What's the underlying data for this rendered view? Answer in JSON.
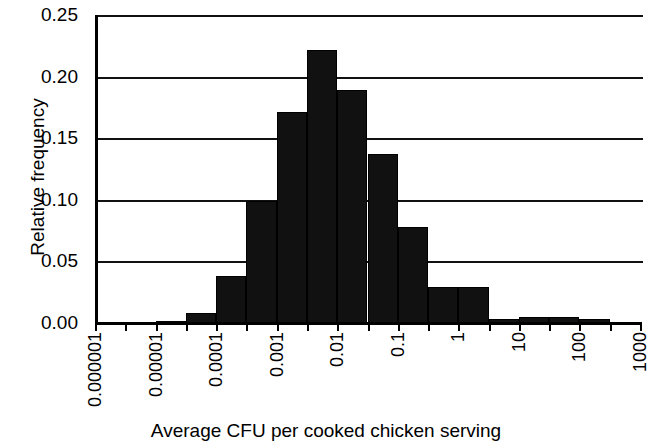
{
  "chart_data": {
    "type": "bar",
    "title": "",
    "subtitle": "",
    "xlabel": "Average CFU per cooked chicken serving",
    "ylabel": "Relative frequency",
    "xscale": "log",
    "xlim": [
      1e-06,
      1000
    ],
    "ylim": [
      0.0,
      0.25
    ],
    "grid": true,
    "legend": null,
    "bar_color": "#111111",
    "axis_color": "#000000",
    "yticks": [
      "0.25",
      "0.20",
      "0.15",
      "0.10",
      "0.05",
      "0.00"
    ],
    "ytick_values": [
      0.25,
      0.2,
      0.15,
      0.1,
      0.05,
      0.0
    ],
    "xticks": [
      "0.000001",
      "0.00001",
      "0.0001",
      "0.001",
      "0.01",
      "0.1",
      "1",
      "10",
      "100",
      "1000"
    ],
    "xtick_values": [
      1e-06,
      1e-05,
      0.0001,
      0.001,
      0.01,
      0.1,
      1,
      10,
      100,
      1000
    ],
    "bins_per_decade": 2,
    "categories": [
      "1e-6",
      "3.2e-6",
      "1e-5",
      "3.2e-5",
      "1e-4",
      "3.2e-4",
      "1e-3",
      "3.2e-3",
      "1e-2",
      "3.2e-2",
      "1e-1",
      "3.2e-1",
      "1",
      "3.2",
      "10",
      "32",
      "100",
      "320"
    ],
    "values": [
      0.0,
      0.0,
      0.002,
      0.008,
      0.038,
      0.099,
      0.171,
      0.222,
      0.189,
      0.137,
      0.078,
      0.029,
      0.029,
      0.003,
      0.005,
      0.005,
      0.003,
      0.0
    ]
  }
}
